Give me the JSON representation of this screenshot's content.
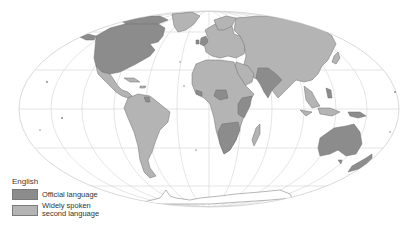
{
  "map": {
    "subject": "English",
    "projection": "Mollweide world map with graticule",
    "colors": {
      "official": "#8c8c8c",
      "second_language": "#b4b4b4",
      "other_land": "#ffffff",
      "borders": "#6e6e6e",
      "graticule": "#d2d2d2",
      "ocean": "#ffffff"
    },
    "regions": {
      "official": [
        "United States",
        "Canada",
        "United Kingdom",
        "Ireland",
        "Australia",
        "New Zealand",
        "Nigeria",
        "Ghana",
        "Kenya",
        "Uganda",
        "Tanzania",
        "Zambia",
        "Zimbabwe",
        "South Africa",
        "Botswana",
        "Namibia",
        "Sierra Leone",
        "Liberia",
        "India",
        "Pakistan",
        "Philippines",
        "Papua New Guinea",
        "Guyana",
        "Belize",
        "Jamaica"
      ],
      "second_language": [
        "Mexico",
        "Central America",
        "South America",
        "Europe",
        "Russia",
        "China",
        "Middle East",
        "North Africa",
        "Central Africa",
        "Southeast Asia",
        "Japan",
        "Greenland",
        "Madagascar"
      ]
    }
  },
  "legend": {
    "title": "English",
    "items": [
      {
        "label": "Official language",
        "color": "#8c8c8c"
      },
      {
        "label_line1": "Widely spoken",
        "label_line2": "second language",
        "color": "#b4b4b4"
      }
    ]
  }
}
